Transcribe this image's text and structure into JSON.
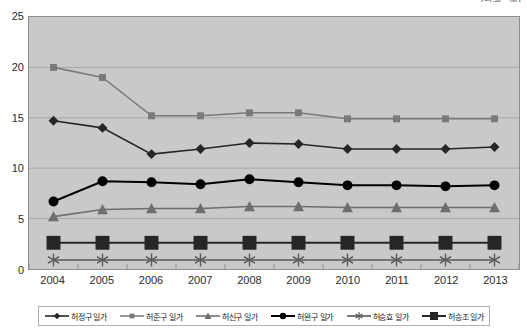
{
  "unit_note": "(단위 : %)",
  "axis": {
    "y_ticks": [
      "0",
      "5",
      "10",
      "15",
      "20",
      "25"
    ],
    "x_ticks": [
      "2004",
      "2005",
      "2006",
      "2007",
      "2008",
      "2009",
      "2010",
      "2011",
      "2012",
      "2013"
    ]
  },
  "legend": {
    "items": [
      {
        "label": "허정구 일가",
        "marker": "diamond",
        "color": "#262626"
      },
      {
        "label": "허준구 일가",
        "marker": "square",
        "color": "#7a7a7a"
      },
      {
        "label": "허신구 일가",
        "marker": "triangle",
        "color": "#6e6e6e"
      },
      {
        "label": "허완구 일가",
        "marker": "circle",
        "color": "#000000"
      },
      {
        "label": "허승효 일가",
        "marker": "star",
        "color": "#595959"
      },
      {
        "label": "허승조 일가",
        "marker": "big-square",
        "color": "#262626"
      }
    ]
  },
  "chart_data": {
    "type": "line",
    "title": "",
    "subtitle": "",
    "xlabel": "",
    "ylabel": "",
    "unit": "(단위 : %)",
    "ylim": [
      0,
      25
    ],
    "ytick_step": 5,
    "grid": true,
    "legend_position": "bottom",
    "plot_background": "#c9c9c9",
    "categories": [
      "2004",
      "2005",
      "2006",
      "2007",
      "2008",
      "2009",
      "2010",
      "2011",
      "2012",
      "2013"
    ],
    "series": [
      {
        "name": "허정구 일가",
        "marker": "diamond",
        "color": "#262626",
        "values": [
          14.7,
          14.0,
          11.4,
          11.9,
          12.5,
          12.4,
          11.9,
          11.9,
          11.9,
          12.1
        ]
      },
      {
        "name": "허준구 일가",
        "marker": "square",
        "color": "#7a7a7a",
        "values": [
          20.0,
          19.0,
          15.2,
          15.2,
          15.5,
          15.5,
          14.9,
          14.9,
          14.9,
          14.9
        ]
      },
      {
        "name": "허신구 일가",
        "marker": "triangle",
        "color": "#6e6e6e",
        "values": [
          5.2,
          5.9,
          6.0,
          6.0,
          6.2,
          6.2,
          6.1,
          6.1,
          6.1,
          6.1
        ]
      },
      {
        "name": "허완구 일가",
        "marker": "circle",
        "color": "#000000",
        "values": [
          6.7,
          8.7,
          8.6,
          8.4,
          8.9,
          8.6,
          8.3,
          8.3,
          8.2,
          8.3
        ]
      },
      {
        "name": "허승효 일가",
        "marker": "star",
        "color": "#595959",
        "values": [
          0.9,
          0.9,
          0.9,
          0.9,
          0.9,
          0.9,
          0.9,
          0.9,
          0.9,
          0.9
        ]
      },
      {
        "name": "허승조 일가",
        "marker": "big-square",
        "color": "#262626",
        "values": [
          2.6,
          2.6,
          2.6,
          2.6,
          2.6,
          2.6,
          2.6,
          2.6,
          2.6,
          2.6
        ]
      }
    ]
  }
}
